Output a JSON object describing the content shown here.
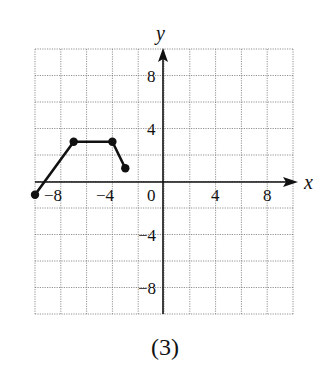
{
  "chart_data": {
    "type": "line",
    "title": "",
    "caption": "(3)",
    "xlabel": "x",
    "ylabel": "y",
    "xlim": [
      -10,
      10
    ],
    "ylim": [
      -10,
      10
    ],
    "grid": true,
    "grid_step": 2,
    "x_ticks": [
      "-8",
      "-4",
      "0",
      "4",
      "8"
    ],
    "y_ticks": [
      "8",
      "4",
      "-4",
      "-8"
    ],
    "series": [
      {
        "name": "graph",
        "points": [
          [
            -10,
            -1
          ],
          [
            -7,
            3
          ],
          [
            -4,
            3
          ],
          [
            -3,
            1
          ]
        ],
        "endpoints": "closed"
      }
    ]
  },
  "labels": {
    "x_axis": "x",
    "y_axis": "y",
    "caption": "(3)",
    "origin": "0",
    "xt_m8": "−8",
    "xt_m4": "−4",
    "xt_4": "4",
    "xt_8": "8",
    "yt_8": "8",
    "yt_4": "4",
    "yt_m4": "−4",
    "yt_m8": "−8"
  }
}
